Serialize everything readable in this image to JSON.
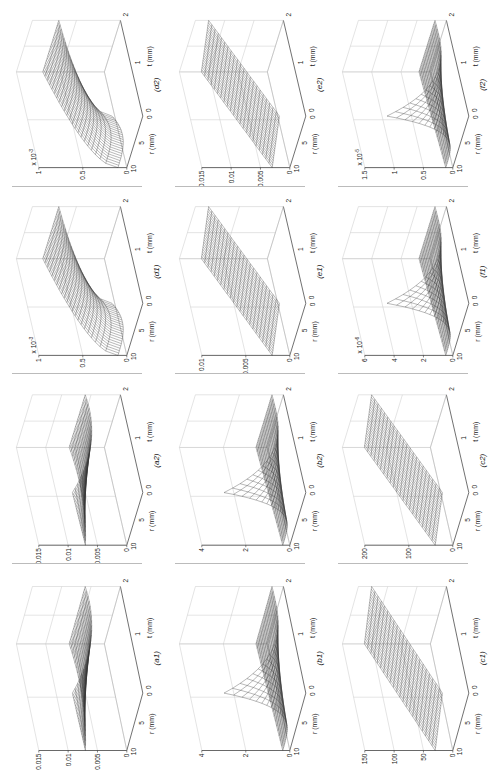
{
  "page": {
    "orientation": "rotated-90"
  },
  "axes_common": {
    "r_label": "r (mm)",
    "t_label": "t (mm)",
    "r_ticks": [
      "10",
      "5",
      "0"
    ],
    "t_ticks": [
      "0",
      "1",
      "2"
    ]
  },
  "chart_data": [
    {
      "id": "a1",
      "type": "surface",
      "panel_label": "(a1)",
      "zlabel": "ΔK_fx-ux (N/μm)",
      "zticks": [
        "0",
        "0.005",
        "0.01",
        "0.015"
      ],
      "zlim": [
        0,
        0.015
      ],
      "exponent": "",
      "shape": "saddle-rise-low-r",
      "xlabel": "r (mm)",
      "ylabel": "t (mm)",
      "xlim": [
        0,
        10
      ],
      "ylim": [
        0,
        2
      ]
    },
    {
      "id": "b1",
      "type": "surface",
      "panel_label": "(b1)",
      "zlabel": "ΔK_fy-uy (N/μm)",
      "zticks": [
        "0",
        "2",
        "4"
      ],
      "zlim": [
        0,
        4
      ],
      "exponent": "",
      "shape": "spike-at-high-r-low-t",
      "xlabel": "r (mm)",
      "ylabel": "t (mm)",
      "xlim": [
        0,
        10
      ],
      "ylim": [
        0,
        2
      ]
    },
    {
      "id": "c1",
      "type": "surface",
      "panel_label": "(c1)",
      "zlabel": "ΔK_fz-uz (N/μm)",
      "zticks": [
        "0",
        "50",
        "100",
        "150"
      ],
      "zlim": [
        0,
        150
      ],
      "exponent": "",
      "shape": "plane-rising-with-t",
      "xlabel": "r (mm)",
      "ylabel": "t (mm)",
      "xlim": [
        0,
        10
      ],
      "ylim": [
        0,
        2
      ]
    },
    {
      "id": "a2",
      "type": "surface",
      "panel_label": "(a2)",
      "zlabel": "ΔK_fx-ux (N/μm)",
      "zticks": [
        "0",
        "0.005",
        "0.01",
        "0.015"
      ],
      "zlim": [
        0,
        0.015
      ],
      "exponent": "",
      "shape": "saddle-rise-low-r",
      "xlabel": "r (mm)",
      "ylabel": "t (mm)",
      "xlim": [
        0,
        10
      ],
      "ylim": [
        0,
        2
      ]
    },
    {
      "id": "b2",
      "type": "surface",
      "panel_label": "(b2)",
      "zlabel": "ΔK_fy-uy (N/μm)",
      "zticks": [
        "0",
        "2",
        "4"
      ],
      "zlim": [
        0,
        4
      ],
      "exponent": "",
      "shape": "spike-at-high-r-low-t",
      "xlabel": "r (mm)",
      "ylabel": "t (mm)",
      "xlim": [
        0,
        10
      ],
      "ylim": [
        0,
        2
      ]
    },
    {
      "id": "c2",
      "type": "surface",
      "panel_label": "(c2)",
      "zlabel": "ΔK_fz-uz (N/μm)",
      "zticks": [
        "0",
        "100",
        "200"
      ],
      "zlim": [
        0,
        200
      ],
      "exponent": "",
      "shape": "plane-rising-with-t",
      "xlabel": "r (mm)",
      "ylabel": "t (mm)",
      "xlim": [
        0,
        10
      ],
      "ylim": [
        0,
        2
      ]
    },
    {
      "id": "d1",
      "type": "surface",
      "panel_label": "(d1)",
      "zlabel": "ΔK_mx-ux (Nm/μrad)",
      "zticks": [
        "0",
        "0.5",
        "1"
      ],
      "zlim": [
        0,
        1
      ],
      "exponent": "x 10^-3",
      "shape": "curved-rise-with-t",
      "xlabel": "r (mm)",
      "ylabel": "t (mm)",
      "xlim": [
        0,
        10
      ],
      "ylim": [
        0,
        2
      ]
    },
    {
      "id": "e1",
      "type": "surface",
      "panel_label": "(e1)",
      "zlabel": "ΔK_my-uy (Nm/μrad)",
      "zticks": [
        "0",
        "0.005",
        "0.01"
      ],
      "zlim": [
        0,
        0.01
      ],
      "exponent": "",
      "shape": "plane-rising-with-t",
      "xlabel": "r (mm)",
      "ylabel": "t (mm)",
      "xlim": [
        0,
        10
      ],
      "ylim": [
        0,
        2
      ]
    },
    {
      "id": "f1",
      "type": "surface",
      "panel_label": "(f1)",
      "zlabel": "ΔK_mz-uz (Nm/μrad)",
      "zticks": [
        "0",
        "2",
        "4",
        "6"
      ],
      "zlim": [
        0,
        6
      ],
      "exponent": "x 10^-6",
      "shape": "spike-at-high-r-low-t",
      "xlabel": "r (mm)",
      "ylabel": "t (mm)",
      "xlim": [
        0,
        10
      ],
      "ylim": [
        0,
        2
      ]
    },
    {
      "id": "d2",
      "type": "surface",
      "panel_label": "(d2)",
      "zlabel": "ΔK_mx-ux (Nm/μrad)",
      "zticks": [
        "0",
        "0.5",
        "1"
      ],
      "zlim": [
        0,
        1
      ],
      "exponent": "x 10^-3",
      "shape": "curved-rise-with-t",
      "xlabel": "r (mm)",
      "ylabel": "t (mm)",
      "xlim": [
        0,
        10
      ],
      "ylim": [
        0,
        2
      ]
    },
    {
      "id": "e2",
      "type": "surface",
      "panel_label": "(e2)",
      "zlabel": "ΔK_my-uy (Nm/μrad)",
      "zticks": [
        "0",
        "0.005",
        "0.01",
        "0.015"
      ],
      "zlim": [
        0,
        0.015
      ],
      "exponent": "",
      "shape": "plane-rising-with-t",
      "xlabel": "r (mm)",
      "ylabel": "t (mm)",
      "xlim": [
        0,
        10
      ],
      "ylim": [
        0,
        2
      ]
    },
    {
      "id": "f2",
      "type": "surface",
      "panel_label": "(f2)",
      "zlabel": "ΔK_mz-uz (Nm/μrad)",
      "zticks": [
        "0",
        "0.5",
        "1",
        "1.5"
      ],
      "zlim": [
        0,
        1.5
      ],
      "exponent": "x 10^-5",
      "shape": "spike-at-high-r-low-t",
      "xlabel": "r (mm)",
      "ylabel": "t (mm)",
      "xlim": [
        0,
        10
      ],
      "ylim": [
        0,
        2
      ]
    }
  ],
  "layout": {
    "rows": [
      [
        "d2",
        "e2",
        "f2"
      ],
      [
        "d1",
        "e1",
        "f1"
      ],
      [
        "a2",
        "b2",
        "c2"
      ],
      [
        "a1",
        "b1",
        "c1"
      ]
    ]
  }
}
